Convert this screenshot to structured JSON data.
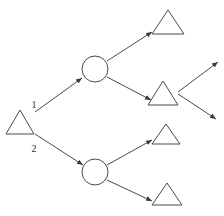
{
  "diagram": {
    "background_color": "#ffffff",
    "stroke_color": "#4a4a4a",
    "label_color": "#2b2b2b",
    "nodes": [
      {
        "id": "root",
        "shape": "triangle",
        "name": "root-triangle",
        "cx": 20,
        "cy": 122,
        "half_width": 14,
        "half_height": 12
      },
      {
        "id": "junc_top",
        "shape": "circle",
        "name": "upper-circle",
        "cx": 95,
        "cy": 69,
        "r": 13
      },
      {
        "id": "junc_bot",
        "shape": "circle",
        "name": "lower-circle",
        "cx": 95,
        "cy": 172,
        "r": 13
      },
      {
        "id": "leaf_1",
        "shape": "triangle",
        "name": "top-right-triangle",
        "cx": 168,
        "cy": 22,
        "half_width": 16,
        "half_height": 12
      },
      {
        "id": "leaf_2",
        "shape": "triangle",
        "name": "middle-right-triangle",
        "cx": 163,
        "cy": 93,
        "half_width": 15,
        "half_height": 12
      },
      {
        "id": "leaf_3",
        "shape": "triangle",
        "name": "lower-mid-triangle",
        "cx": 166,
        "cy": 134,
        "half_width": 14,
        "half_height": 10
      },
      {
        "id": "leaf_4",
        "shape": "triangle",
        "name": "bottom-right-triangle",
        "cx": 167,
        "cy": 194,
        "half_width": 15,
        "half_height": 11
      }
    ],
    "edges": [
      {
        "id": "e1",
        "name": "edge-root-to-upper-circle",
        "from": "root",
        "to": "junc_top",
        "x1": 35,
        "y1": 112,
        "x2": 82,
        "y2": 78,
        "label": "1",
        "label_x": 34,
        "label_y": 108,
        "arrowhead": true
      },
      {
        "id": "e2",
        "name": "edge-root-to-lower-circle",
        "from": "root",
        "to": "junc_bot",
        "x1": 35,
        "y1": 134,
        "x2": 83,
        "y2": 165,
        "label": "2",
        "label_x": 34,
        "label_y": 152,
        "arrowhead": true
      },
      {
        "id": "e3",
        "name": "edge-upper-circle-to-leaf-1",
        "from": "junc_top",
        "to": "leaf_1",
        "x1": 107,
        "y1": 61,
        "x2": 152,
        "y2": 32,
        "label": "",
        "label_x": 0,
        "label_y": 0,
        "arrowhead": true
      },
      {
        "id": "e4",
        "name": "edge-upper-circle-to-leaf-2",
        "from": "junc_top",
        "to": "leaf_2",
        "x1": 107,
        "y1": 77,
        "x2": 151,
        "y2": 100,
        "label": "",
        "label_x": 0,
        "label_y": 0,
        "arrowhead": true
      },
      {
        "id": "e5",
        "name": "edge-lower-circle-to-leaf-3",
        "from": "junc_bot",
        "to": "leaf_3",
        "x1": 107,
        "y1": 165,
        "x2": 152,
        "y2": 140,
        "label": "",
        "label_x": 0,
        "label_y": 0,
        "arrowhead": true
      },
      {
        "id": "e6",
        "name": "edge-lower-circle-to-leaf-4",
        "from": "junc_bot",
        "to": "leaf_4",
        "x1": 107,
        "y1": 180,
        "x2": 152,
        "y2": 201,
        "label": "",
        "label_x": 0,
        "label_y": 0,
        "arrowhead": true
      },
      {
        "id": "e7",
        "name": "edge-leaf-2-out-upper",
        "from": "leaf_2",
        "to": "",
        "x1": 178,
        "y1": 92,
        "x2": 218,
        "y2": 62,
        "label": "",
        "label_x": 0,
        "label_y": 0,
        "arrowhead": true
      },
      {
        "id": "e8",
        "name": "edge-leaf-2-out-lower",
        "from": "leaf_2",
        "to": "",
        "x1": 178,
        "y1": 94,
        "x2": 216,
        "y2": 119,
        "label": "",
        "label_x": 0,
        "label_y": 0,
        "arrowhead": true
      }
    ]
  }
}
